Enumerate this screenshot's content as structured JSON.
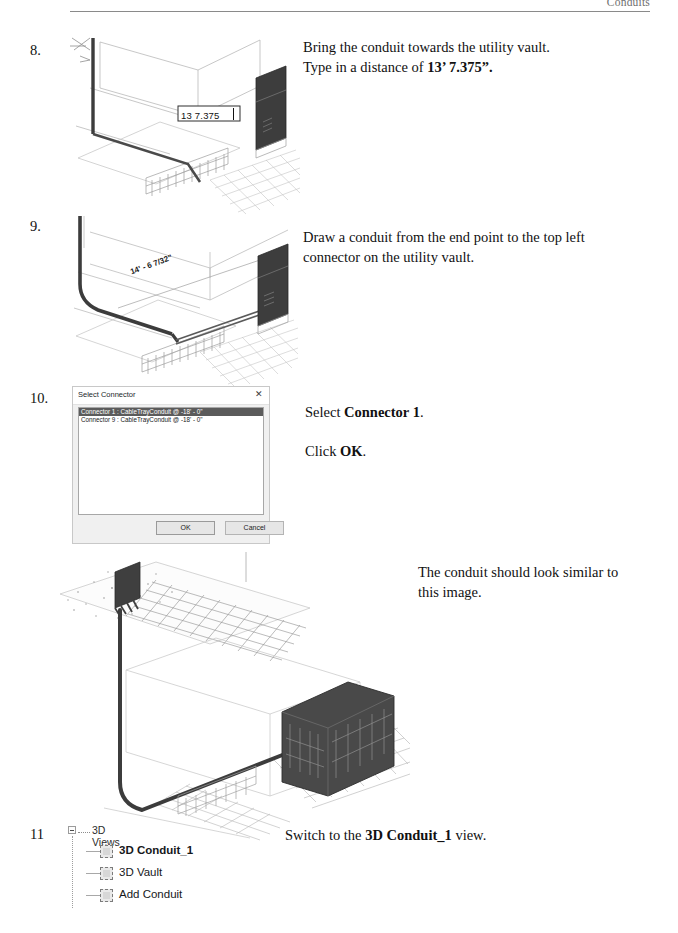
{
  "page": {
    "header_text": "Conduits"
  },
  "steps": [
    {
      "number": "8.",
      "lines": [
        {
          "plain_before": "Bring the conduit towards the utility vault.",
          "bold": "",
          "plain_after": ""
        },
        {
          "plain_before": "Type in a distance of ",
          "bold": "13’ 7.375”.",
          "plain_after": ""
        }
      ],
      "figure": {
        "dimension_input_value": "13 7.375"
      }
    },
    {
      "number": "9.",
      "lines": [
        {
          "plain_before": "Draw a conduit from the end point to the top left",
          "bold": "",
          "plain_after": ""
        },
        {
          "plain_before": "connector on the utility vault.",
          "bold": "",
          "plain_after": ""
        }
      ],
      "figure": {
        "dimension_label": "14' - 6 7/32\""
      }
    },
    {
      "number": "10.",
      "lines": [
        {
          "plain_before": "Select ",
          "bold": "Connector 1",
          "plain_after": "."
        },
        {
          "plain_before": "Click ",
          "bold": "OK",
          "plain_after": "."
        }
      ]
    },
    {
      "number": "11",
      "lines": [
        {
          "plain_before": "Switch to the ",
          "bold": "3D Conduit_1",
          "plain_after": " view."
        }
      ]
    }
  ],
  "result_note": {
    "line1": "The conduit should look similar to",
    "line2": "this image."
  },
  "connector_dialog": {
    "title": "Select Connector",
    "close_icon": "close-icon",
    "close_glyph": "✕",
    "items": [
      {
        "label": "Connector 1 : CableTrayConduit @ -18' - 0\"",
        "selected": true
      },
      {
        "label": "Connector 9 : CableTrayConduit @ -18' - 0\"",
        "selected": false
      }
    ],
    "ok_label": "OK",
    "cancel_label": "Cancel"
  },
  "project_browser": {
    "root_label": "3D Views",
    "expander_icon": "collapse-minus-icon",
    "children": [
      {
        "label": "3D Conduit_1",
        "icon": "view-3d-icon",
        "active": true
      },
      {
        "label": "3D Vault",
        "icon": "view-3d-icon",
        "active": false
      },
      {
        "label": "Add Conduit",
        "icon": "view-3d-icon",
        "active": false
      }
    ]
  },
  "colors": {
    "page_background": "#ffffff",
    "text": "#111111",
    "header_rule": "#8a8a8a",
    "dialog_selection": "#5b5b5b",
    "conduit_dark": "#3a3a3a",
    "line_light": "#b9b9b9"
  }
}
